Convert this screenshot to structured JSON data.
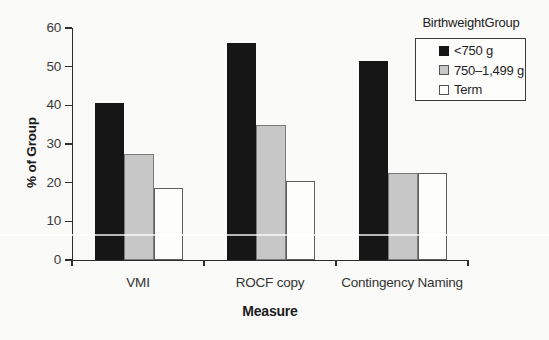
{
  "figure": {
    "background": "#fafaf8"
  },
  "chart_data": {
    "type": "bar",
    "title": "",
    "xlabel": "Measure",
    "ylabel": "% of Group",
    "categories": [
      "VMI",
      "ROCF copy",
      "Contingency Naming"
    ],
    "series": [
      {
        "name": "<750 g",
        "fill": "#161616",
        "border": "#161616",
        "values": [
          40.5,
          56,
          51.5
        ]
      },
      {
        "name": "750–1,499 g",
        "fill": "#c7c7c7",
        "border": "#7a7a7a",
        "values": [
          27.5,
          35,
          22.5
        ]
      },
      {
        "name": "Term",
        "fill": "#fdfdfc",
        "border": "#5f5f5f",
        "values": [
          18.5,
          20.5,
          22.5
        ]
      }
    ],
    "ylim": [
      0,
      60
    ],
    "yticks": [
      0,
      10,
      20,
      30,
      40,
      50,
      60
    ],
    "grid": false,
    "legend_title": "BirthweightGroup",
    "legend_position": "top-right",
    "axis_color": "#2d2d2d",
    "tick_label_color": "#3a3a3a"
  }
}
